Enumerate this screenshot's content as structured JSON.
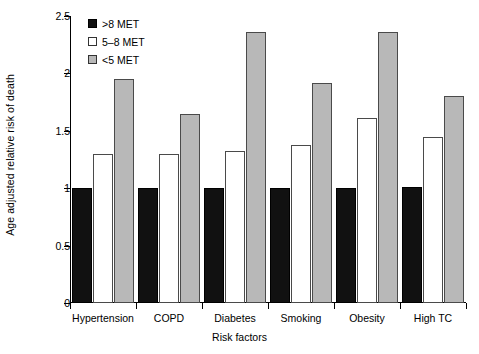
{
  "chart_data": {
    "type": "bar",
    "title": "",
    "xlabel": "Risk factors",
    "ylabel": "Age adjusted relative risk of death",
    "ylim": [
      0,
      2.5
    ],
    "yticks": [
      0,
      0.5,
      1,
      1.5,
      2,
      2.5
    ],
    "ytick_labels": [
      "0",
      "0.5",
      "1",
      "1.5",
      "2",
      "2.5"
    ],
    "grid": false,
    "legend_position": "top-left",
    "categories": [
      "Hypertension",
      "COPD",
      "Diabetes",
      "Smoking",
      "Obesity",
      "High TC"
    ],
    "series": [
      {
        "name": ">8 MET",
        "swatch": "s0",
        "color": "#111111",
        "values": [
          1.0,
          1.0,
          1.0,
          1.0,
          1.0,
          1.01
        ]
      },
      {
        "name": "5–8 MET",
        "swatch": "s1",
        "color": "#ffffff",
        "values": [
          1.3,
          1.3,
          1.32,
          1.38,
          1.61,
          1.45
        ]
      },
      {
        "name": "<5 MET",
        "swatch": "s2",
        "color": "#b8b8b8",
        "values": [
          1.95,
          1.65,
          2.36,
          1.92,
          2.36,
          1.8
        ]
      }
    ]
  }
}
